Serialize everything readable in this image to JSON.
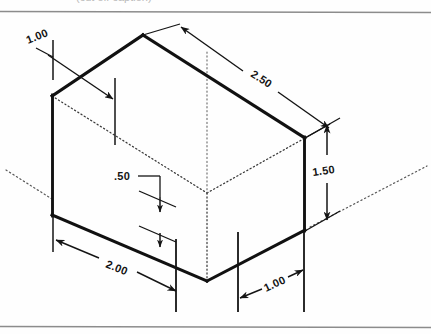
{
  "page": {
    "background_color": "#fefefe",
    "line_color": "#141414",
    "border_color": "#8c8c8c",
    "partial_top_caption": "(cut off caption)"
  },
  "frame": {
    "top_rule_y": 11,
    "bottom_rule_y": 327
  },
  "drawing": {
    "type": "isometric-projection",
    "object": "rectangular-block",
    "visible_edges": [
      {
        "name": "top-back-left",
        "from": [
          52,
          96
        ],
        "to": [
          143,
          35
        ]
      },
      {
        "name": "top-back-right",
        "from": [
          143,
          35
        ],
        "to": [
          305,
          138
        ]
      },
      {
        "name": "left-vertical",
        "from": [
          52,
          96
        ],
        "to": [
          52,
          215
        ]
      },
      {
        "name": "bottom-front-left",
        "from": [
          52,
          215
        ],
        "to": [
          207,
          281
        ]
      },
      {
        "name": "bottom-front-right",
        "from": [
          207,
          281
        ],
        "to": [
          305,
          230
        ]
      },
      {
        "name": "right-vertical",
        "from": [
          305,
          138
        ],
        "to": [
          305,
          230
        ]
      }
    ],
    "hidden_edges": [
      {
        "name": "front-top-left",
        "from": [
          52,
          96
        ],
        "to": [
          207,
          193
        ]
      },
      {
        "name": "front-top-right",
        "from": [
          207,
          193
        ],
        "to": [
          305,
          138
        ]
      },
      {
        "name": "front-vertical",
        "from": [
          207,
          193
        ],
        "to": [
          207,
          281
        ]
      }
    ],
    "axis_lines": [
      {
        "name": "left-axis",
        "from": [
          8,
          172
        ],
        "to": [
          52,
          200
        ]
      },
      {
        "name": "right-axis",
        "from": [
          312,
          225
        ],
        "to": [
          424,
          168
        ]
      },
      {
        "name": "center-axis",
        "from": [
          207,
          52
        ],
        "to": [
          207,
          193
        ]
      }
    ]
  },
  "dimensions": [
    {
      "id": "depth-top-left",
      "value": "1.00",
      "label_x": 28,
      "label_y": 44,
      "rotation": -22,
      "description": "notch depth at upper left"
    },
    {
      "id": "length-top-right",
      "value": "2.50",
      "label_x": 255,
      "label_y": 72,
      "rotation": 33,
      "description": "overall length along top right edge"
    },
    {
      "id": "height-right",
      "value": "1.50",
      "label_x": 333,
      "label_y": 172,
      "rotation": -8,
      "description": "overall height at right side"
    },
    {
      "id": "height-mid",
      "value": ".50",
      "label_x": 114,
      "label_y": 178,
      "rotation": 0,
      "description": "partial height, front face"
    },
    {
      "id": "width-bottom-left",
      "value": "2.00",
      "label_x": 110,
      "label_y": 263,
      "rotation": 22,
      "description": "overall width along bottom left edge"
    },
    {
      "id": "width-bottom-right",
      "value": "1.00",
      "label_x": 271,
      "label_y": 289,
      "rotation": -25,
      "description": "width along bottom right edge"
    }
  ]
}
